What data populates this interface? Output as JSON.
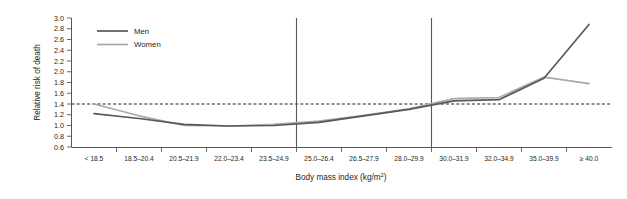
{
  "chart_data": {
    "type": "line",
    "title": "",
    "xlabel": "Body mass index (kg/m2)",
    "xlabel_base": "Body mass index (kg/m",
    "xlabel_sup": "2",
    "xlabel_tail": ")",
    "ylabel": "Relative risk of death",
    "ylim": [
      0.6,
      3.0
    ],
    "ytick_step": 0.2,
    "grid": false,
    "legend_position": "top-left",
    "categories": [
      "< 18.5",
      "18.5–20.4",
      "20.5–21.9",
      "22.0–23.4",
      "23.5–24.9",
      "25.0–26.4",
      "26.5–27.9",
      "28.0–29.9",
      "30.0–31.9",
      "32.0–34.9",
      "35.0–39.9",
      "≥ 40.0"
    ],
    "yticks": [
      "0.6",
      "0.8",
      "1.0",
      "1.2",
      "1.4",
      "1.6",
      "1.8",
      "2.0",
      "2.2",
      "2.4",
      "2.6",
      "2.8",
      "3.0"
    ],
    "series": [
      {
        "name": "Men",
        "color": "#58585a",
        "values": [
          1.22,
          1.13,
          1.02,
          0.99,
          1.0,
          1.06,
          1.18,
          1.3,
          1.46,
          1.48,
          1.88,
          2.88
        ]
      },
      {
        "name": "Women",
        "color": "#a7a9ac",
        "values": [
          1.4,
          1.18,
          1.0,
          0.99,
          1.02,
          1.08,
          1.19,
          1.31,
          1.5,
          1.52,
          1.9,
          1.78
        ]
      }
    ],
    "reference_lines": {
      "horizontal": [
        {
          "value": 1.0,
          "style": "dashed",
          "color": "#231f20"
        }
      ],
      "vertical": [
        {
          "at_category": "25.0–26.4",
          "edge": "left",
          "color": "#58585a"
        },
        {
          "at_category": "30.0–31.9",
          "edge": "left",
          "color": "#58585a"
        }
      ]
    },
    "legend": [
      {
        "label": "Men",
        "color": "#58585a"
      },
      {
        "label": "Women",
        "color": "#a7a9ac"
      }
    ]
  }
}
